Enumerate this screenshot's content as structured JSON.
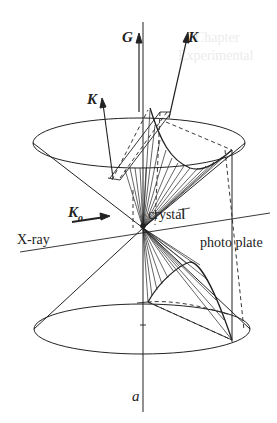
{
  "figure": {
    "labels": {
      "G": "G",
      "K_top": "K",
      "K_left": "K",
      "K0": "K",
      "K0_sub": "o",
      "xray": "X-ray",
      "crystal": "crystal",
      "photo_plate": "photo plate",
      "axis": "a"
    },
    "bleed_through": {
      "line1": "Chapter",
      "line2": "Experimental"
    },
    "colors": {
      "ink": "#222222",
      "background": "#ffffff",
      "bleed": "#ececec"
    }
  }
}
